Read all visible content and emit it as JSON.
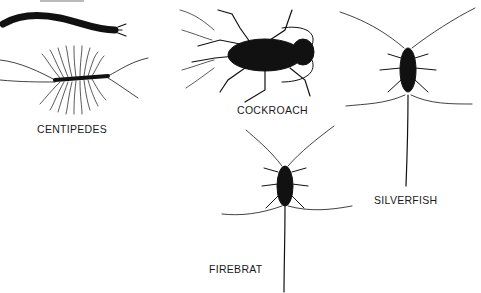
{
  "figure": {
    "top_caption_partial": "",
    "specimens": [
      {
        "id": "centipedes",
        "label": "CENTIPEDES"
      },
      {
        "id": "cockroach",
        "label": "COCKROACH"
      },
      {
        "id": "silverfish",
        "label": "SILVERFISH"
      },
      {
        "id": "firebrat",
        "label": "FIREBRAT"
      }
    ]
  },
  "colors": {
    "ink": "#111111",
    "background": "#ffffff"
  }
}
